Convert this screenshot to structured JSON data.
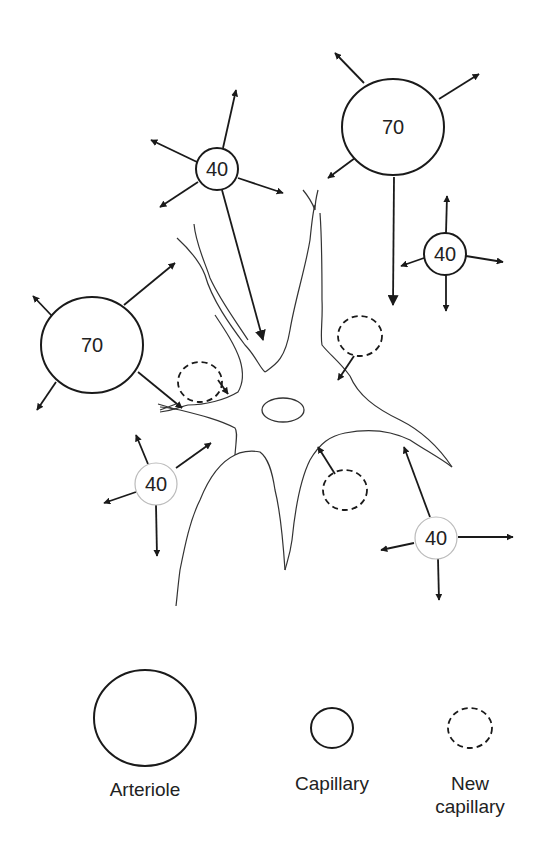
{
  "diagram": {
    "vessels": [
      {
        "id": "capillary-top-left",
        "type": "capillary",
        "label": "40",
        "cx": 217,
        "cy": 169,
        "r": 21
      },
      {
        "id": "arteriole-top-right",
        "type": "arteriole",
        "label": "70",
        "cx": 393,
        "cy": 127,
        "r": 50
      },
      {
        "id": "capillary-right",
        "type": "capillary",
        "label": "40",
        "cx": 445,
        "cy": 254,
        "r": 21
      },
      {
        "id": "arteriole-left",
        "type": "arteriole",
        "label": "70",
        "cx": 92,
        "cy": 317,
        "r": 51
      },
      {
        "id": "capillary-bottom-left",
        "type": "capillary",
        "label": "40",
        "cx": 156,
        "cy": 484,
        "r": 21
      },
      {
        "id": "capillary-bottom-right",
        "type": "capillary",
        "label": "40",
        "cx": 436,
        "cy": 538,
        "r": 21
      }
    ],
    "new_capillaries": [
      {
        "id": "new-capillary-left",
        "cx": 200,
        "cy": 383
      },
      {
        "id": "new-capillary-upper-right",
        "cx": 360,
        "cy": 336
      },
      {
        "id": "new-capillary-lower",
        "cx": 345,
        "cy": 490
      }
    ],
    "cell": {
      "name": "neuron",
      "nucleus": {
        "cx": 283,
        "cy": 410,
        "rx": 21,
        "ry": 12
      }
    },
    "legend": {
      "items": [
        {
          "label": "Arteriole",
          "style": "solid-large"
        },
        {
          "label": "Capillary",
          "style": "solid-small"
        },
        {
          "label_line1": "New",
          "label_line2": "capillary",
          "style": "dashed-small"
        }
      ]
    },
    "colors": {
      "stroke": "#1a1a1a",
      "background": "#ffffff"
    }
  }
}
